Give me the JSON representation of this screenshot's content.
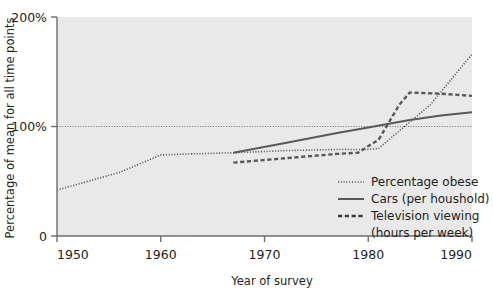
{
  "chart_data": {
    "type": "line",
    "title": "",
    "xlabel": "Year of survey",
    "ylabel": "Percentage of mean for all time points",
    "xlim": [
      1950,
      1990
    ],
    "ylim": [
      0,
      200
    ],
    "xticks": [
      1950,
      1960,
      1970,
      1980,
      1990
    ],
    "xtick_labels": [
      "1950",
      "1960",
      "1970",
      "1980",
      "1990"
    ],
    "yticks": [
      0,
      100,
      200
    ],
    "ytick_labels": [
      "0",
      "100%",
      "200%"
    ],
    "grid": false,
    "reference_line": {
      "y": 100,
      "style": "dotted"
    },
    "legend_position": "inside-lower-right",
    "series": [
      {
        "name": "Percentage obese",
        "style": "dotted",
        "color": "#58595b",
        "x": [
          1950,
          1953,
          1956,
          1960,
          1963,
          1967,
          1972,
          1977,
          1980,
          1981,
          1982,
          1986,
          1990
        ],
        "y": [
          42,
          50,
          58,
          74,
          75,
          76,
          78,
          79,
          79,
          80,
          88,
          120,
          166
        ]
      },
      {
        "name": "Cars (per houshold)",
        "style": "solid",
        "color": "#58595b",
        "x": [
          1967,
          1972,
          1977,
          1980,
          1984,
          1987,
          1990
        ],
        "y": [
          76,
          85,
          94,
          99,
          106,
          110,
          113
        ]
      },
      {
        "name": "Television viewing (hours per week)",
        "style": "dashed",
        "color": "#3b3b3d",
        "x": [
          1967,
          1972,
          1977,
          1979,
          1981,
          1983,
          1984,
          1987,
          1990
        ],
        "y": [
          67,
          71,
          75,
          76,
          88,
          120,
          131,
          130,
          128
        ]
      }
    ],
    "legend_entries": [
      {
        "label": "Percentage obese",
        "style": "dotted"
      },
      {
        "label": "Cars (per houshold)",
        "style": "solid"
      },
      {
        "label": "Television viewing",
        "style": "dashed"
      },
      {
        "label": "(hours per week)",
        "style": "none"
      }
    ]
  }
}
